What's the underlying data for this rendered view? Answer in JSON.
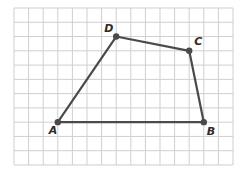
{
  "diagram": {
    "type": "quadrilateral-on-grid",
    "grid": {
      "columns": 15,
      "rows": 11,
      "origin_px": [
        14,
        8
      ],
      "cell_w": 14.6,
      "cell_h": 14.27,
      "line_color": "#cfcfcf"
    },
    "shape_color": "#4a4a4a",
    "points": [
      {
        "name": "A",
        "label": "A",
        "grid": [
          3,
          8
        ],
        "label_offset": [
          -9,
          12
        ]
      },
      {
        "name": "B",
        "label": "B",
        "grid": [
          13,
          8
        ],
        "label_offset": [
          3,
          13
        ]
      },
      {
        "name": "C",
        "label": "C",
        "grid": [
          12,
          3
        ],
        "label_offset": [
          5,
          -6
        ]
      },
      {
        "name": "D",
        "label": "D",
        "grid": [
          7,
          2
        ],
        "label_offset": [
          -12,
          -5
        ]
      }
    ],
    "edges": [
      [
        "A",
        "B"
      ],
      [
        "B",
        "C"
      ],
      [
        "C",
        "D"
      ],
      [
        "D",
        "A"
      ]
    ]
  }
}
